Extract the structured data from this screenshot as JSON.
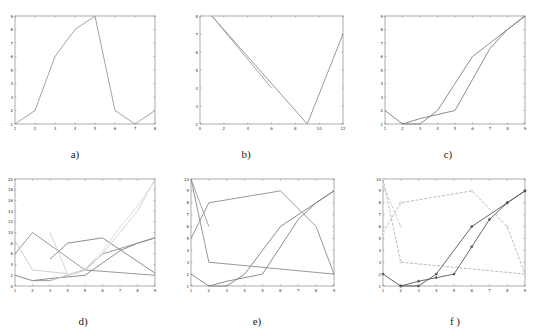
{
  "chart_data": [
    {
      "id": "a",
      "caption": "a)",
      "type": "line",
      "xlim": [
        1,
        8
      ],
      "ylim": [
        1,
        9
      ],
      "xticks": [
        1,
        2,
        3,
        4,
        5,
        6,
        7,
        8
      ],
      "yticks": [
        1,
        2,
        3,
        4,
        5,
        6,
        7,
        8,
        9
      ],
      "series": [
        {
          "name": "s1",
          "color": "#9a9a9a",
          "dash": "",
          "markers": false,
          "x": [
            1,
            2,
            3,
            4,
            5,
            6,
            7,
            8
          ],
          "y": [
            1,
            2,
            6,
            8,
            9,
            2,
            1,
            2
          ]
        }
      ]
    },
    {
      "id": "b",
      "caption": "b)",
      "type": "line",
      "xlim": [
        0,
        12
      ],
      "ylim": [
        2,
        8
      ],
      "xticks": [
        0,
        2,
        4,
        6,
        8,
        10,
        12
      ],
      "yticks": [
        2,
        3,
        4,
        5,
        6,
        7,
        8
      ],
      "series": [
        {
          "name": "s1",
          "color": "#8c8c8c",
          "dash": "",
          "markers": false,
          "x": [
            1,
            9,
            12
          ],
          "y": [
            8,
            2,
            7
          ]
        },
        {
          "name": "s2",
          "color": "#9a9a9a",
          "dash": "",
          "markers": false,
          "x": [
            1,
            6
          ],
          "y": [
            8,
            4
          ]
        }
      ]
    },
    {
      "id": "c",
      "caption": "c)",
      "type": "line",
      "xlim": [
        1,
        9
      ],
      "ylim": [
        1,
        9
      ],
      "xticks": [
        1,
        2,
        3,
        4,
        5,
        6,
        7,
        8,
        9
      ],
      "yticks": [
        1,
        2,
        3,
        4,
        5,
        6,
        7,
        8,
        9
      ],
      "series": [
        {
          "name": "s1",
          "color": "#7f7f7f",
          "dash": "",
          "markers": false,
          "x": [
            1,
            2,
            3,
            4,
            5,
            6,
            7,
            8,
            9
          ],
          "y": [
            2,
            1,
            1.4,
            1.7,
            2,
            4.3,
            6.6,
            8,
            9
          ]
        },
        {
          "name": "s2",
          "color": "#7f7f7f",
          "dash": "",
          "markers": false,
          "x": [
            2,
            3,
            4,
            5,
            6,
            7,
            8,
            9
          ],
          "y": [
            1,
            1,
            2,
            4,
            6,
            7,
            8,
            9
          ]
        }
      ]
    },
    {
      "id": "d",
      "caption": "d)",
      "type": "line",
      "xlim": [
        1,
        9
      ],
      "ylim": [
        0,
        20
      ],
      "xticks": [
        1,
        2,
        3,
        4,
        5,
        6,
        7,
        8,
        9
      ],
      "yticks": [
        0,
        2,
        4,
        6,
        8,
        10,
        12,
        14,
        16,
        18,
        20
      ],
      "series": [
        {
          "name": "s1",
          "color": "#7f7f7f",
          "dash": "",
          "markers": false,
          "x": [
            1,
            2,
            3,
            4,
            5,
            6,
            7,
            8,
            9
          ],
          "y": [
            2,
            1,
            1.4,
            1.7,
            2,
            4.3,
            6.6,
            8,
            9
          ]
        },
        {
          "name": "s2",
          "color": "#7f7f7f",
          "dash": "",
          "markers": false,
          "x": [
            3,
            4,
            6,
            9
          ],
          "y": [
            5,
            8,
            9,
            2.4
          ]
        },
        {
          "name": "s3",
          "color": "#8c8c8c",
          "dash": "",
          "markers": false,
          "x": [
            1,
            2,
            5,
            9
          ],
          "y": [
            6,
            10,
            3,
            2
          ]
        },
        {
          "name": "s4",
          "color": "#8c8c8c",
          "dash": "",
          "markers": false,
          "x": [
            2,
            3,
            4,
            5,
            6,
            7,
            8,
            9
          ],
          "y": [
            1,
            1,
            2,
            3,
            6,
            7,
            8,
            9
          ]
        },
        {
          "name": "s5",
          "color": "#c8c8c8",
          "dash": "",
          "markers": false,
          "x": [
            1,
            2,
            4
          ],
          "y": [
            8.5,
            3,
            2.3
          ]
        },
        {
          "name": "s6",
          "color": "#cfcfcf",
          "dash": "",
          "markers": false,
          "x": [
            3,
            4
          ],
          "y": [
            10,
            2.3
          ]
        },
        {
          "name": "s7",
          "color": "#d0d0d0",
          "dash": "",
          "markers": false,
          "x": [
            3,
            4,
            5,
            6,
            7,
            8,
            9
          ],
          "y": [
            1,
            2,
            3,
            6,
            10,
            14,
            20
          ]
        },
        {
          "name": "s8",
          "color": "#d8d8d8",
          "dash": "",
          "markers": false,
          "x": [
            4,
            5,
            6,
            7,
            8,
            9
          ],
          "y": [
            2,
            3.2,
            6.5,
            11,
            15,
            19.6
          ]
        }
      ]
    },
    {
      "id": "e",
      "caption": "e)",
      "type": "line",
      "xlim": [
        1,
        9
      ],
      "ylim": [
        1,
        10
      ],
      "xticks": [
        1,
        2,
        3,
        4,
        5,
        6,
        7,
        8,
        9
      ],
      "yticks": [
        1,
        2,
        3,
        4,
        5,
        6,
        7,
        8,
        9,
        10
      ],
      "series": [
        {
          "name": "s1",
          "color": "#7f7f7f",
          "dash": "",
          "markers": false,
          "x": [
            1,
            2,
            3,
            4,
            5,
            6,
            7,
            8,
            9
          ],
          "y": [
            2,
            1,
            1.4,
            1.7,
            2,
            4.3,
            6.6,
            8,
            9
          ]
        },
        {
          "name": "s2",
          "color": "#7f7f7f",
          "dash": "",
          "markers": false,
          "x": [
            2,
            3,
            4,
            5,
            6,
            7,
            8,
            9
          ],
          "y": [
            1,
            1,
            2,
            4,
            6,
            7,
            8,
            9
          ]
        },
        {
          "name": "s3",
          "color": "#8c8c8c",
          "dash": "",
          "markers": false,
          "x": [
            1,
            2,
            6,
            8,
            9
          ],
          "y": [
            5,
            8,
            9,
            6,
            2
          ]
        },
        {
          "name": "s4",
          "color": "#8c8c8c",
          "dash": "",
          "markers": false,
          "x": [
            1,
            2,
            9
          ],
          "y": [
            10,
            3,
            2
          ]
        },
        {
          "name": "s5",
          "color": "#9a9a9a",
          "dash": "",
          "markers": false,
          "x": [
            1,
            2
          ],
          "y": [
            10,
            6
          ]
        }
      ]
    },
    {
      "id": "f",
      "caption": "f )",
      "type": "line",
      "xlim": [
        1,
        9
      ],
      "ylim": [
        1,
        10
      ],
      "xticks": [
        1,
        2,
        3,
        4,
        5,
        6,
        7,
        8,
        9
      ],
      "yticks": [
        1,
        2,
        3,
        4,
        5,
        6,
        7,
        8,
        9,
        10
      ],
      "series": [
        {
          "name": "s1",
          "color": "#555555",
          "dash": "",
          "markers": true,
          "x": [
            1,
            2,
            3,
            4,
            5,
            6,
            7,
            8,
            9
          ],
          "y": [
            2,
            1,
            1.4,
            1.7,
            2,
            4.3,
            6.6,
            8,
            9
          ]
        },
        {
          "name": "s2",
          "color": "#555555",
          "dash": "",
          "markers": true,
          "x": [
            2,
            3,
            4,
            6,
            8,
            9
          ],
          "y": [
            1,
            1,
            2,
            6,
            8,
            9
          ]
        },
        {
          "name": "s3",
          "color": "#b4b4b4",
          "dash": "3,1.5",
          "markers": true,
          "x": [
            1,
            2,
            6,
            8,
            9
          ],
          "y": [
            5.5,
            8,
            9,
            6,
            2
          ]
        },
        {
          "name": "s4",
          "color": "#b4b4b4",
          "dash": "3,1.5",
          "markers": true,
          "x": [
            1,
            2,
            9
          ],
          "y": [
            10,
            3,
            2
          ]
        },
        {
          "name": "s5",
          "color": "#c0c0c0",
          "dash": "3,1.5",
          "markers": true,
          "x": [
            1,
            2
          ],
          "y": [
            9.5,
            6
          ]
        }
      ]
    }
  ],
  "captions": {
    "a": "a)",
    "b": "b)",
    "c": "c)",
    "d": "d)",
    "e": "e)",
    "f": "f )"
  }
}
